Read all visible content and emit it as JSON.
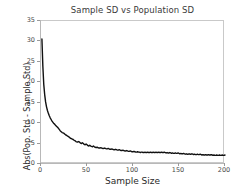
{
  "figure": {
    "width": 243,
    "height": 192,
    "background": "#ffffff",
    "line_color": "#111111",
    "axis_color": "#b8b8b8",
    "tick_label_color": "#4a4a4a"
  },
  "chart_data": {
    "type": "line",
    "title": "Sample SD vs Population SD",
    "xlabel": "Sample Size",
    "ylabel": "Abs(Pop. Std - Sample Std)",
    "xlim": [
      0,
      200
    ],
    "ylim": [
      0,
      35
    ],
    "xticks": [
      0,
      50,
      100,
      150,
      200
    ],
    "xtick_labels": [
      "0",
      "50",
      "100",
      "150",
      "200"
    ],
    "yticks": [
      0,
      5,
      10,
      15,
      20,
      25,
      30,
      35
    ],
    "ytick_labels": [
      "0",
      "5",
      "10",
      "15",
      "20",
      "25",
      "30",
      "35"
    ],
    "grid": false,
    "legend": null,
    "series": [
      {
        "name": "Abs(Pop. Std - Sample Std)",
        "color": "#111111",
        "linewidth": 1.4,
        "x": [
          1,
          2,
          3,
          4,
          5,
          6,
          7,
          8,
          9,
          10,
          11,
          12,
          13,
          14,
          15,
          16,
          17,
          18,
          19,
          20,
          21,
          22,
          23,
          24,
          25,
          26,
          27,
          28,
          29,
          30,
          31,
          32,
          33,
          34,
          35,
          36,
          37,
          38,
          39,
          40,
          41,
          42,
          43,
          44,
          45,
          46,
          47,
          48,
          49,
          50,
          51,
          52,
          53,
          54,
          55,
          56,
          57,
          58,
          59,
          60,
          61,
          62,
          63,
          64,
          65,
          66,
          67,
          68,
          69,
          70,
          71,
          72,
          73,
          74,
          75,
          76,
          77,
          78,
          79,
          80,
          81,
          82,
          83,
          84,
          85,
          86,
          87,
          88,
          89,
          90,
          91,
          92,
          93,
          94,
          95,
          96,
          97,
          98,
          99,
          100,
          101,
          102,
          103,
          104,
          105,
          106,
          107,
          108,
          109,
          110,
          111,
          112,
          113,
          114,
          115,
          116,
          117,
          118,
          119,
          120,
          121,
          122,
          123,
          124,
          125,
          126,
          127,
          128,
          129,
          130,
          131,
          132,
          133,
          134,
          135,
          136,
          137,
          138,
          139,
          140,
          141,
          142,
          143,
          144,
          145,
          146,
          147,
          148,
          149,
          150,
          151,
          152,
          153,
          154,
          155,
          156,
          157,
          158,
          159,
          160,
          161,
          162,
          163,
          164,
          165,
          166,
          167,
          168,
          169,
          170,
          171,
          172,
          173,
          174,
          175,
          176,
          177,
          178,
          179,
          180,
          181,
          182,
          183,
          184,
          185,
          186,
          187,
          188,
          189,
          190,
          191,
          192,
          193,
          194,
          195,
          196,
          197,
          198,
          199,
          200
        ],
        "y": [
          30.6,
          24.0,
          19.5,
          17.0,
          15.2,
          14.0,
          13.1,
          12.4,
          11.8,
          11.3,
          10.9,
          10.5,
          10.2,
          9.9,
          9.7,
          9.4,
          9.2,
          9.0,
          8.7,
          8.4,
          8.1,
          7.9,
          7.7,
          7.6,
          7.5,
          7.3,
          7.1,
          7.0,
          6.8,
          6.7,
          6.5,
          6.3,
          6.2,
          6.1,
          6.0,
          5.8,
          5.7,
          5.5,
          5.4,
          5.4,
          5.5,
          5.3,
          5.1,
          5.0,
          5.2,
          5.0,
          4.8,
          4.7,
          4.9,
          4.7,
          4.5,
          4.4,
          4.6,
          4.4,
          4.3,
          4.2,
          4.4,
          4.2,
          4.1,
          4.0,
          4.1,
          4.0,
          3.9,
          3.9,
          4.0,
          3.9,
          3.8,
          3.8,
          3.9,
          3.8,
          3.7,
          3.7,
          3.8,
          3.7,
          3.6,
          3.6,
          3.7,
          3.6,
          3.5,
          3.5,
          3.6,
          3.5,
          3.4,
          3.4,
          3.5,
          3.4,
          3.3,
          3.3,
          3.4,
          3.3,
          3.2,
          3.2,
          3.3,
          3.2,
          3.1,
          3.1,
          3.2,
          3.1,
          3.0,
          3.0,
          3.1,
          3.0,
          2.9,
          2.9,
          3.0,
          2.9,
          2.9,
          2.8,
          2.9,
          2.9,
          2.8,
          2.8,
          2.9,
          2.8,
          2.8,
          2.9,
          2.8,
          2.8,
          2.9,
          2.8,
          2.8,
          2.9,
          2.8,
          2.8,
          2.9,
          2.8,
          2.8,
          2.9,
          2.8,
          2.8,
          2.9,
          2.8,
          2.8,
          2.9,
          2.8,
          2.7,
          2.8,
          2.7,
          2.7,
          2.8,
          2.7,
          2.6,
          2.7,
          2.6,
          2.6,
          2.7,
          2.6,
          2.6,
          2.7,
          2.6,
          2.5,
          2.6,
          2.5,
          2.5,
          2.6,
          2.5,
          2.4,
          2.5,
          2.4,
          2.4,
          2.5,
          2.4,
          2.4,
          2.5,
          2.4,
          2.3,
          2.4,
          2.3,
          2.3,
          2.4,
          2.3,
          2.3,
          2.4,
          2.3,
          2.2,
          2.3,
          2.2,
          2.2,
          2.3,
          2.2,
          2.2,
          2.3,
          2.2,
          2.2,
          2.3,
          2.2,
          2.1,
          2.2,
          2.1,
          2.1,
          2.2,
          2.1,
          2.1,
          2.2,
          2.1,
          2.1,
          2.2,
          2.1,
          2.1,
          2.2
        ]
      }
    ]
  }
}
